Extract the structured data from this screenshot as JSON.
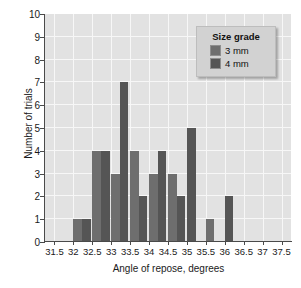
{
  "chart_data": {
    "type": "bar",
    "title": "",
    "subtitle": "",
    "xlabel": "Angle of repose, degrees",
    "ylabel": "Number of trials",
    "xlim": [
      31.25,
      37.75
    ],
    "ylim": [
      0,
      10
    ],
    "xticks": [
      "31.5",
      "32",
      "32.5",
      "33",
      "33.5",
      "34",
      "34.5",
      "35",
      "35.5",
      "36",
      "36.5",
      "37",
      "37.5"
    ],
    "xtick_values": [
      31.5,
      32,
      32.5,
      33,
      33.5,
      34,
      34.5,
      35,
      35.5,
      36,
      36.5,
      37,
      37.5
    ],
    "yticks": [
      "0",
      "1",
      "2",
      "3",
      "4",
      "5",
      "6",
      "7",
      "8",
      "9",
      "10"
    ],
    "ytick_values": [
      0,
      1,
      2,
      3,
      4,
      5,
      6,
      7,
      8,
      9,
      10
    ],
    "grid": true,
    "grid_color": "#f7f7f7",
    "plot_background": "#e2e2e2",
    "legend_position": "top-right",
    "categories": [
      32,
      32.5,
      33,
      33.5,
      34,
      34.5,
      35,
      35.5,
      36
    ],
    "series": [
      {
        "name": "3 mm",
        "color": "#6e6e6e",
        "values": [
          1,
          4,
          3,
          4,
          3,
          3,
          0,
          1,
          0
        ]
      },
      {
        "name": "4 mm",
        "color": "#555555",
        "values": [
          1,
          4,
          7,
          2,
          4,
          2,
          5,
          0,
          2
        ]
      }
    ],
    "bars": [
      {
        "x": 32,
        "series": "3 mm",
        "value": 1,
        "color": "#6e6e6e"
      },
      {
        "x": 32,
        "series": "4 mm",
        "value": 1,
        "color": "#555555"
      },
      {
        "x": 32.5,
        "series": "3 mm",
        "value": 4,
        "color": "#6e6e6e"
      },
      {
        "x": 32.5,
        "series": "4 mm",
        "value": 4,
        "color": "#555555"
      },
      {
        "x": 33,
        "series": "3 mm",
        "value": 3,
        "color": "#6e6e6e"
      },
      {
        "x": 33,
        "series": "4 mm",
        "value": 7,
        "color": "#555555"
      },
      {
        "x": 33.5,
        "series": "3 mm",
        "value": 4,
        "color": "#6e6e6e"
      },
      {
        "x": 33.5,
        "series": "4 mm",
        "value": 2,
        "color": "#555555"
      },
      {
        "x": 34,
        "series": "3 mm",
        "value": 3,
        "color": "#6e6e6e"
      },
      {
        "x": 34,
        "series": "4 mm",
        "value": 4,
        "color": "#555555"
      },
      {
        "x": 34.5,
        "series": "3 mm",
        "value": 3,
        "color": "#6e6e6e"
      },
      {
        "x": 34.5,
        "series": "4 mm",
        "value": 2,
        "color": "#555555"
      },
      {
        "x": 35,
        "series": "4 mm",
        "value": 5,
        "color": "#555555"
      },
      {
        "x": 35.5,
        "series": "3 mm",
        "value": 1,
        "color": "#6e6e6e"
      },
      {
        "x": 36,
        "series": "4 mm",
        "value": 2,
        "color": "#555555"
      }
    ]
  },
  "legend": {
    "title": "Size grade",
    "entries": [
      {
        "label": "3 mm",
        "color": "#6e6e6e"
      },
      {
        "label": "4 mm",
        "color": "#555555"
      }
    ]
  }
}
